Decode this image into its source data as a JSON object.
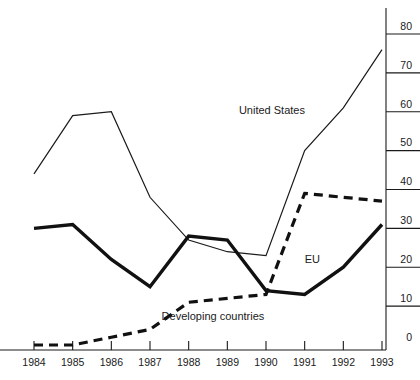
{
  "chart_data": {
    "type": "line",
    "title": "",
    "subtitle": "",
    "xlabel": "",
    "ylabel": "",
    "x": [
      1984,
      1985,
      1986,
      1987,
      1988,
      1989,
      1990,
      1991,
      1992,
      1993
    ],
    "categories": [
      "1984",
      "1985",
      "1986",
      "1987",
      "1988",
      "1989",
      "1990",
      "1991",
      "1992",
      "1993"
    ],
    "xlim": [
      1984,
      1993
    ],
    "ylim": [
      0,
      80
    ],
    "ytick_values": [
      0,
      10,
      20,
      30,
      40,
      50,
      60,
      70,
      80
    ],
    "ytick_labels": [
      "0",
      "10",
      "20",
      "30",
      "40",
      "50",
      "60",
      "70",
      "80"
    ],
    "yaxis_position": "right",
    "grid": false,
    "legend_position": "inline-annotations",
    "series": [
      {
        "name": "United States",
        "style": "thin-solid",
        "color": "#1a1a1a",
        "values": [
          44,
          59,
          60,
          38,
          27,
          24,
          23,
          50,
          61,
          76
        ],
        "label": "United States",
        "label_x": 1989.3,
        "label_y": 59.5
      },
      {
        "name": "EU",
        "style": "thick-solid",
        "color": "#111111",
        "values": [
          30,
          31,
          22,
          15,
          28,
          27,
          14,
          13,
          20,
          31
        ],
        "label": "EU",
        "label_x": 1991.0,
        "label_y": 21.0
      },
      {
        "name": "Developing countries",
        "style": "thick-dashed",
        "color": "#111111",
        "values": [
          0,
          0,
          2,
          4,
          11,
          12,
          13,
          39,
          38,
          37
        ],
        "label": "Developing countries",
        "label_x": 1987.3,
        "label_y": 6.5
      }
    ],
    "annotations": [
      {
        "text": "United States",
        "x": 1989.3,
        "y": 59.5
      },
      {
        "text": "EU",
        "x": 1991.0,
        "y": 21.0
      },
      {
        "text": "Developing countries",
        "x": 1987.3,
        "y": 6.5
      }
    ]
  },
  "axes": {
    "x_tick_labels": [
      "1984",
      "1985",
      "1986",
      "1987",
      "1988",
      "1989",
      "1990",
      "1991",
      "1992",
      "1993"
    ],
    "y_tick_labels": [
      "80",
      "70",
      "60",
      "50",
      "40",
      "30",
      "20",
      "10",
      "0"
    ]
  }
}
